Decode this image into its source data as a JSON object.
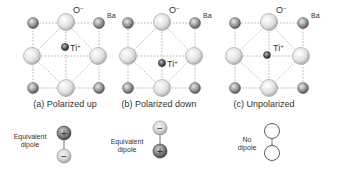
{
  "colors": {
    "ba_fill": "#8c8c8c",
    "o_fill": "#e4e4e4",
    "ti_fill": "#555555",
    "line": "#9a9a9a",
    "text": "#333333"
  },
  "labels": {
    "oxygen": "O",
    "oxygen_charge": "−",
    "barium": "Ba",
    "titanium": "Ti",
    "titanium_charge": "+"
  },
  "panels": [
    {
      "id": "a",
      "caption": "(a)  Polarized up",
      "ti_offset": -9,
      "dipole_label_1": "Equivalent",
      "dipole_label_2": "dipole",
      "dipole_top": "+",
      "dipole_bottom": "−"
    },
    {
      "id": "b",
      "caption": "(b)  Polarized down",
      "ti_offset": 7,
      "dipole_label_1": "Equivalent",
      "dipole_label_2": "dipole",
      "dipole_top": "−",
      "dipole_bottom": "+"
    },
    {
      "id": "c",
      "caption": "(c)  Unpolarized",
      "ti_offset": 0,
      "dipole_label_1": "No",
      "dipole_label_2": "dipole",
      "dipole_top": "",
      "dipole_bottom": ""
    }
  ]
}
